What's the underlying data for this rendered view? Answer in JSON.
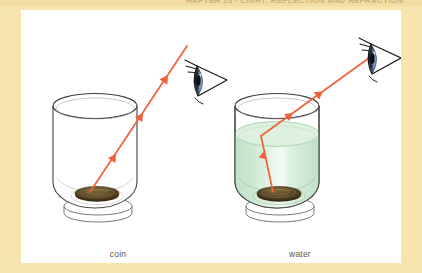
{
  "figure": {
    "clipped_heading": "HAPTER 23 · LIGHT: REFLECTION AND REFRACTION",
    "panel_background": "#ffffff",
    "page_background": "#f7e5b0",
    "captions": {
      "left": "coin",
      "right": "water"
    },
    "colors": {
      "ray": "#f0653c",
      "ray_dark": "#d9472a",
      "glass_outline": "#4b4b4b",
      "water_fill": "#c9e5cd",
      "water_highlight": "#eef8f0",
      "coin_body": "#5c4a2a",
      "coin_rim": "#8c7242",
      "eye_iris": "#5b7fb5",
      "eye_pupil": "#1b1b1b",
      "eye_outline": "#1a1a1a",
      "caption_text": "#58595b",
      "border_cream": "#f7e5b0"
    },
    "panels": [
      {
        "id": "empty-glass",
        "name": "coin-in-empty-glass",
        "caption": "coin",
        "has_water": false,
        "ray_type": "straight",
        "ray_description": "Straight light ray travels from the coin at the bottom of the glass up to the eye",
        "arrow_count": 3
      },
      {
        "id": "water-glass",
        "name": "coin-in-water-glass",
        "caption": "water",
        "has_water": true,
        "ray_type": "refracted",
        "ray_description": "Light ray from the coin bends at the water surface then continues to the eye",
        "arrow_count": 3
      }
    ],
    "objects": {
      "glass_label": "drinking glass",
      "coin_label": "coin",
      "eye_label": "observer eye",
      "water_surface_label": "water surface"
    }
  }
}
